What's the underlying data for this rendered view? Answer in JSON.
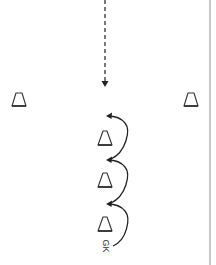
{
  "diagram": {
    "colors": {
      "line": "#222222",
      "cone": "#333333",
      "border": "#c8c8c8",
      "background": "#ffffff"
    },
    "ball_path": {
      "type": "dashed-arrow",
      "from": [
        105,
        0
      ],
      "to": [
        105,
        86
      ],
      "direction": "down"
    },
    "cones": [
      {
        "id": "left-cone",
        "x": 19,
        "y": 99
      },
      {
        "id": "right-cone",
        "x": 191,
        "y": 99
      },
      {
        "id": "center-cone-1",
        "x": 105,
        "y": 138
      },
      {
        "id": "center-cone-2",
        "x": 105,
        "y": 180
      },
      {
        "id": "center-cone-3",
        "x": 105,
        "y": 224
      }
    ],
    "movement_arrows": [
      {
        "id": "curve-1",
        "from": [
          110,
          160
        ],
        "to": [
          106,
          116
        ]
      },
      {
        "id": "curve-2",
        "from": [
          110,
          204
        ],
        "to": [
          106,
          160
        ]
      },
      {
        "id": "curve-3",
        "from": [
          112,
          246
        ],
        "to": [
          106,
          204
        ]
      }
    ],
    "labels": {
      "goalkeeper": "GK"
    },
    "icons": {
      "cone": "triangle-outline",
      "arrowhead": "filled-triangle"
    }
  }
}
